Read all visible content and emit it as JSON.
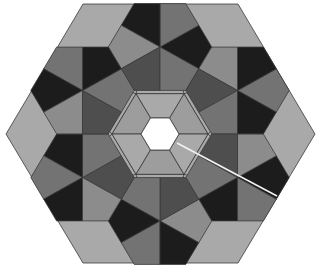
{
  "figure": {
    "width": 319,
    "height": 270
  },
  "geometry": {
    "center": [
      160,
      134
    ],
    "unit": 25.83,
    "y_scale": 0.97,
    "outer_hex_vertices": [
      [
        6,
        134
      ],
      [
        83,
        4
      ],
      [
        238,
        4
      ],
      [
        315,
        134
      ],
      [
        238,
        263
      ],
      [
        83,
        263
      ]
    ],
    "center_hole_radius": 19,
    "inner_ring_radius": 48,
    "hub_radius": 51.7,
    "hub_centers": [
      [
        160,
        47
      ],
      [
        237.5,
        90.5
      ],
      [
        237.5,
        177.5
      ],
      [
        160,
        221
      ],
      [
        82.5,
        177.5
      ],
      [
        82.5,
        90.5
      ]
    ]
  },
  "colors": {
    "background": "#ffffff",
    "hole": "#ffffff",
    "light": "#a9a9a9",
    "medium_light": "#8c8c8c",
    "medium": "#737373",
    "medium_dark": "#5f5f5f",
    "dark": "#4e4e4e",
    "black": "#1c1c1c",
    "outline": "#3a3a3a",
    "slash_line": "#f2f2f2"
  },
  "hub_kite_color_cycle": [
    "black",
    "medium",
    "black",
    "medium_light",
    "dark",
    "medium"
  ],
  "slash_line": {
    "from": [
      177,
      143
    ],
    "to": [
      277,
      196
    ]
  }
}
